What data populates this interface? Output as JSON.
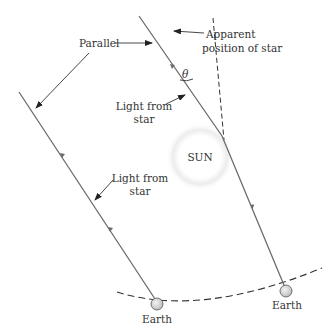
{
  "figure": {
    "type": "diagram",
    "labels": {
      "parallel": "Parallel",
      "apparent_line1": "Apparent",
      "apparent_line2": "position of star",
      "light_upper_line1": "Light from",
      "light_upper_line2": "star",
      "light_lower_line1": "Light from",
      "light_lower_line2": "star",
      "theta": "θ",
      "sun": "SUN",
      "earth_left": "Earth",
      "earth_right": "Earth"
    },
    "colors": {
      "ray": "#6b6b6b",
      "text": "#333333",
      "earth_fill": "#d8d8d8",
      "sun_glow": "#e6e6e6",
      "background": "#ffffff"
    }
  }
}
